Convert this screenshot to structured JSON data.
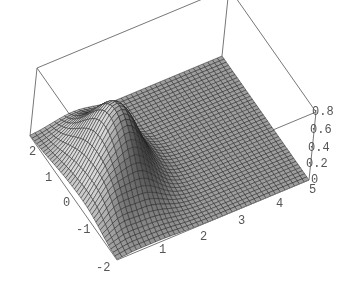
{
  "chart_data": {
    "type": "surface3d",
    "title": "",
    "xlabel": "",
    "ylabel": "",
    "zlabel": "",
    "xlim": [
      0,
      5
    ],
    "ylim": [
      -2,
      2
    ],
    "zlim": [
      0,
      0.8
    ],
    "x_ticks": [
      "1",
      "2",
      "3",
      "4",
      "5"
    ],
    "y_ticks": [
      "-2",
      "-1",
      "0",
      "1",
      "2"
    ],
    "z_ticks": [
      "0",
      "0.2",
      "0.4",
      "0.6",
      "0.8"
    ],
    "mesh": {
      "nx": 40,
      "ny": 40
    },
    "peak": {
      "x": 1.1,
      "y": 0.2,
      "z": 0.8
    },
    "style": {
      "colormap": "grayscale",
      "mesh_lines": true,
      "bounding_box": true
    }
  },
  "colors": {
    "box": "#777777",
    "mesh": "#222222",
    "tick_text": "#555555"
  }
}
